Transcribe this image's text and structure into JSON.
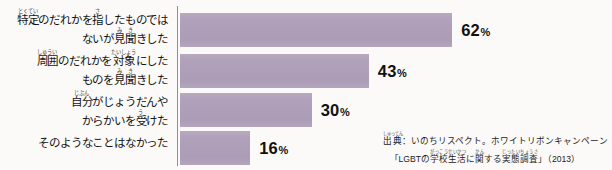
{
  "chart_data": {
    "type": "bar",
    "orientation": "horizontal",
    "title": "",
    "xlabel": "",
    "ylabel": "",
    "xlim": [
      0,
      100
    ],
    "unit": "%",
    "grid": false,
    "legend": "none",
    "bar_color": "#b0a0ba",
    "axis_color": "#6b6b6b",
    "background_color": "#fbfaf8",
    "categories": [
      "特定のだれかを指したものではないが見聞きした",
      "周囲のだれかを対象にしたものを見聞きした",
      "自分がじょうだんやからかいを受けた",
      "そのようなことはなかった"
    ],
    "values": [
      62,
      43,
      30,
      16
    ],
    "value_labels": [
      "62",
      "43",
      "30",
      "16"
    ],
    "percent_sign": "%"
  },
  "labels": [
    {
      "line1_pre": "",
      "ruby1_base": "特定",
      "ruby1_text": "とくてい",
      "line1_mid": "のだれかを",
      "ruby2_base": "指",
      "ruby2_text": "さ",
      "line1_post": "したものでは",
      "line2_pre": "ないが",
      "ruby3_base": "見",
      "ruby3_text": "み",
      "ruby4_base": "聞",
      "ruby4_text": "き",
      "line2_post": "きした"
    },
    {
      "ruby1_base": "周囲",
      "ruby1_text": "しゅうい",
      "line1_mid": "のだれかを",
      "ruby2_base": "対象",
      "ruby2_text": "たいしょう",
      "line1_post": "にした",
      "line2_pre": "ものを",
      "ruby3_base": "見",
      "ruby3_text": "み",
      "ruby4_base": "聞",
      "ruby4_text": "き",
      "line2_post": "きした"
    },
    {
      "ruby1_base": "自分",
      "ruby1_text": "じぶん",
      "line1_post": "がじょうだんや",
      "line2_pre": "からかいを",
      "ruby3_base": "受",
      "ruby3_text": "う",
      "line2_post": "けた"
    },
    {
      "single": "そのようなことはなかった"
    }
  ],
  "source": {
    "line1_ruby_base": "出典",
    "line1_ruby_text": "しゅってん",
    "line1_rest": "：いのちリスペクト。ホワイトリボンキャンペーン",
    "line2_open": "「",
    "line2_lgbt": "LGBT",
    "line2_mid1": "の",
    "line2_ruby1_base": "学校生活",
    "line2_ruby1_text": "がっこうせいかつ",
    "line2_mid2": "に",
    "line2_ruby2_base": "関",
    "line2_ruby2_text": "かん",
    "line2_mid3": "する",
    "line2_ruby3_base": "実態調査",
    "line2_ruby3_text": "じったいちょうさ",
    "line2_close": "」（2013）"
  }
}
